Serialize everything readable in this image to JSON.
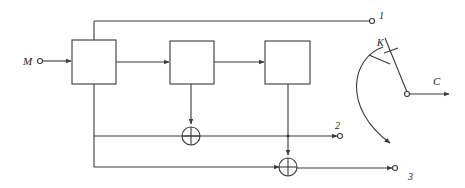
{
  "figure": {
    "kind": "block-diagram",
    "stroke_color": "#3a3a3a",
    "background_color": "#ffffff",
    "label_color": "#1a1a1a"
  },
  "labels": {
    "input": "M",
    "output": "C",
    "switch": "K",
    "tap1": "1",
    "tap2": "2",
    "tap3": "3"
  },
  "blocks": [
    {
      "id": "stage-1",
      "label": "",
      "x": 72,
      "y": 40,
      "w": 44,
      "h": 44
    },
    {
      "id": "stage-2",
      "label": "",
      "x": 170,
      "y": 41,
      "w": 44,
      "h": 43
    },
    {
      "id": "stage-3",
      "label": "",
      "x": 265,
      "y": 41,
      "w": 45,
      "h": 43
    }
  ],
  "xor_gates": [
    {
      "id": "xor-1",
      "cx": 191,
      "cy": 136,
      "r": 9
    },
    {
      "id": "xor-2",
      "cx": 288,
      "cy": 167,
      "r": 9
    }
  ],
  "terminals": [
    {
      "id": "terminal-input-M",
      "cx": 40,
      "cy": 61,
      "r": 2.5,
      "label": "M"
    },
    {
      "id": "terminal-out-1",
      "cx": 372,
      "cy": 21,
      "r": 2.5,
      "label": "1"
    },
    {
      "id": "terminal-out-2",
      "cx": 340,
      "cy": 136,
      "r": 2.5,
      "label": "2"
    },
    {
      "id": "terminal-out-3",
      "cx": 395,
      "cy": 168,
      "r": 2.5,
      "label": "3"
    },
    {
      "id": "terminal-switch-pivot",
      "cx": 407,
      "cy": 94,
      "r": 2.5,
      "label": ""
    }
  ],
  "label_positions": {
    "M": {
      "x": 23,
      "y": 56
    },
    "C": {
      "x": 433,
      "y": 76
    },
    "K": {
      "x": 377,
      "y": 38
    },
    "1": {
      "x": 379,
      "y": 11
    },
    "2": {
      "x": 335,
      "y": 121
    },
    "3": {
      "x": 408,
      "y": 172
    }
  }
}
